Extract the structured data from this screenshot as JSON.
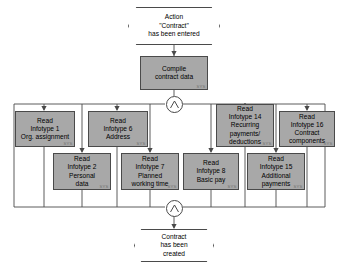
{
  "diagram": {
    "type": "event-driven-process-chain",
    "colors": {
      "function_fill": "#a8a8a8",
      "event_fill": "#ffffff",
      "stroke": "#4a4a4a",
      "text": "#000000",
      "sysmark": "#6f6f6f"
    },
    "start_event": {
      "shape": "hexagon",
      "lines": [
        "Action",
        "\"Contract\"",
        "has been entered"
      ]
    },
    "compile_function": {
      "shape": "rectangle",
      "lines": [
        "Compile",
        "contract data"
      ],
      "sysmark": "SYS"
    },
    "split_connector": {
      "shape": "circle",
      "operator": "AND",
      "glyph": "and-split-icon"
    },
    "join_connector": {
      "shape": "circle",
      "operator": "AND",
      "glyph": "and-join-icon"
    },
    "end_event": {
      "shape": "hexagon",
      "lines": [
        "Contract",
        "has been",
        "created"
      ]
    },
    "functions_row_one": [
      {
        "lines": [
          "Read",
          "Infotype 1",
          "Org. assignment"
        ],
        "sysmark": "SYS"
      },
      {
        "lines": [
          "Read",
          "Infotype 6",
          "Address"
        ],
        "sysmark": "SYS"
      },
      {
        "lines": [
          "Read",
          "Infotype 14",
          "Recurring",
          "payments/",
          "deductions"
        ],
        "sysmark": "SYS"
      },
      {
        "lines": [
          "Read",
          "Infotype 16",
          "Contract",
          "components"
        ],
        "sysmark": "SYS"
      }
    ],
    "functions_row_two": [
      {
        "lines": [
          "Read",
          "Infotype 2",
          "Personal",
          "data"
        ],
        "sysmark": "SYS"
      },
      {
        "lines": [
          "Read",
          "Infotype 7",
          "Planned",
          "working time"
        ],
        "sysmark": "SYS"
      },
      {
        "lines": [
          "Read",
          "Infotype 8",
          "Basic pay"
        ],
        "sysmark": "SYS"
      },
      {
        "lines": [
          "Read",
          "Infotype 15",
          "Additional",
          "payments"
        ],
        "sysmark": "SYS"
      }
    ]
  }
}
